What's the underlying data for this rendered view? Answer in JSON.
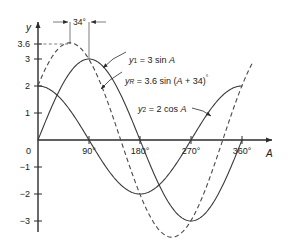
{
  "figure": {
    "background": "#ffffff",
    "curve_color": "#3a3a3a",
    "axis_color": "#2b2b2b"
  },
  "axes": {
    "x": {
      "label": "A",
      "ticks": [
        "90°",
        "180°",
        "270°",
        "360°"
      ],
      "tick_values": [
        90,
        180,
        270,
        360
      ],
      "range": [
        0,
        400
      ]
    },
    "y": {
      "label": "y",
      "ticks": [
        "3.6",
        "3",
        "2",
        "1",
        "0",
        "−1",
        "−2",
        "−3"
      ],
      "tick_values": [
        3.6,
        3,
        2,
        1,
        0,
        -1,
        -2,
        -3
      ],
      "range": [
        -3.9,
        4.0
      ]
    },
    "origin_label": "0"
  },
  "annotations": {
    "phase_shift": "34°",
    "peak_guide_value": "3.6"
  },
  "labels": {
    "y1": {
      "name": "y",
      "sub": "1",
      "eq": "= 3 sin ",
      "var": "A"
    },
    "yR": {
      "name": "y",
      "sub": "R",
      "eq": "= 3.6 sin (",
      "var": "A",
      "eq2": " + 34)",
      "deg": "°"
    },
    "y2": {
      "name": "y",
      "sub": "2",
      "eq": "= 2 cos ",
      "var": "A"
    }
  },
  "chart_data": {
    "type": "line",
    "title": "",
    "xlabel": "A",
    "ylabel": "y",
    "xlim": [
      0,
      400
    ],
    "ylim": [
      -3.9,
      4.0
    ],
    "grid": false,
    "legend": "inline-annotations",
    "xticks": [
      90,
      180,
      270,
      360
    ],
    "xticklabels": [
      "90°",
      "180°",
      "270°",
      "360°"
    ],
    "yticks": [
      3.6,
      3,
      2,
      1,
      0,
      -1,
      -2,
      -3
    ],
    "yticklabels": [
      "3.6",
      "3",
      "2",
      "1",
      "0",
      "−1",
      "−2",
      "−3"
    ],
    "series": [
      {
        "name": "y1 = 3 sin A",
        "style": "solid",
        "formula": "3*sin(A)",
        "amplitude": 3,
        "phase_deg": 0,
        "maximum": {
          "x": 90,
          "y": 3
        },
        "minimum": {
          "x": 270,
          "y": -3
        },
        "zeros": [
          0,
          180,
          360
        ],
        "points": [
          {
            "x": 0,
            "y": 0
          },
          {
            "x": 30,
            "y": 1.5
          },
          {
            "x": 60,
            "y": 2.6
          },
          {
            "x": 90,
            "y": 3
          },
          {
            "x": 120,
            "y": 2.6
          },
          {
            "x": 150,
            "y": 1.5
          },
          {
            "x": 180,
            "y": 0
          },
          {
            "x": 210,
            "y": -1.5
          },
          {
            "x": 240,
            "y": -2.6
          },
          {
            "x": 270,
            "y": -3
          },
          {
            "x": 300,
            "y": -2.6
          },
          {
            "x": 330,
            "y": -1.5
          },
          {
            "x": 360,
            "y": 0
          }
        ]
      },
      {
        "name": "y2 = 2 cos A",
        "style": "solid",
        "formula": "2*cos(A)",
        "amplitude": 2,
        "phase_deg": 90,
        "maximum": {
          "x": 0,
          "y": 2
        },
        "minimum": {
          "x": 180,
          "y": -2
        },
        "zeros": [
          90,
          270
        ],
        "points": [
          {
            "x": 0,
            "y": 2
          },
          {
            "x": 30,
            "y": 1.73
          },
          {
            "x": 60,
            "y": 1
          },
          {
            "x": 90,
            "y": 0
          },
          {
            "x": 120,
            "y": -1
          },
          {
            "x": 150,
            "y": -1.73
          },
          {
            "x": 180,
            "y": -2
          },
          {
            "x": 210,
            "y": -1.73
          },
          {
            "x": 240,
            "y": -1
          },
          {
            "x": 270,
            "y": 0
          },
          {
            "x": 300,
            "y": 1
          },
          {
            "x": 330,
            "y": 1.73
          },
          {
            "x": 360,
            "y": 2
          }
        ]
      },
      {
        "name": "yR = 3.6 sin (A + 34)°",
        "style": "dashed",
        "formula": "3.6*sin(A+34)",
        "amplitude": 3.6,
        "phase_deg": 34,
        "maximum": {
          "x": 56,
          "y": 3.6
        },
        "minimum": {
          "x": 236,
          "y": -3.6
        },
        "zeros": [
          146,
          326
        ],
        "points": [
          {
            "x": 0,
            "y": 2.01
          },
          {
            "x": 30,
            "y": 3.32
          },
          {
            "x": 56,
            "y": 3.6
          },
          {
            "x": 90,
            "y": 2.98
          },
          {
            "x": 120,
            "y": 1.75
          },
          {
            "x": 146,
            "y": 0
          },
          {
            "x": 180,
            "y": -2.01
          },
          {
            "x": 210,
            "y": -3.32
          },
          {
            "x": 236,
            "y": -3.6
          },
          {
            "x": 270,
            "y": -2.98
          },
          {
            "x": 300,
            "y": -1.75
          },
          {
            "x": 326,
            "y": 0
          },
          {
            "x": 360,
            "y": 2.01
          }
        ]
      }
    ]
  }
}
